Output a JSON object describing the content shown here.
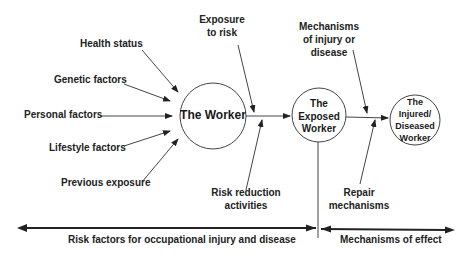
{
  "nodes": {
    "worker": "The Worker",
    "exposed": [
      "The",
      "Exposed",
      "Worker"
    ],
    "injured": [
      "The",
      "Injured/",
      "Diseased",
      "Worker"
    ]
  },
  "inputs": {
    "health_status": "Health status",
    "genetic_factors": "Genetic factors",
    "personal_factors": "Personal factors",
    "lifestyle_factors": "Lifestyle factors",
    "previous_exposure": "Previous exposure"
  },
  "modifiers": {
    "exposure_to_risk": [
      "Exposure",
      "to risk"
    ],
    "risk_reduction": [
      "Risk reduction",
      "activities"
    ],
    "mechanisms_injury": [
      "Mechanisms",
      "of injury or",
      "disease"
    ],
    "repair": [
      "Repair",
      "mechanisms"
    ]
  },
  "bottom": {
    "left_label": "Risk factors for occupational injury and disease",
    "right_label": "Mechanisms of effect"
  },
  "colors": {
    "line": "#333333",
    "text": "#222222"
  }
}
